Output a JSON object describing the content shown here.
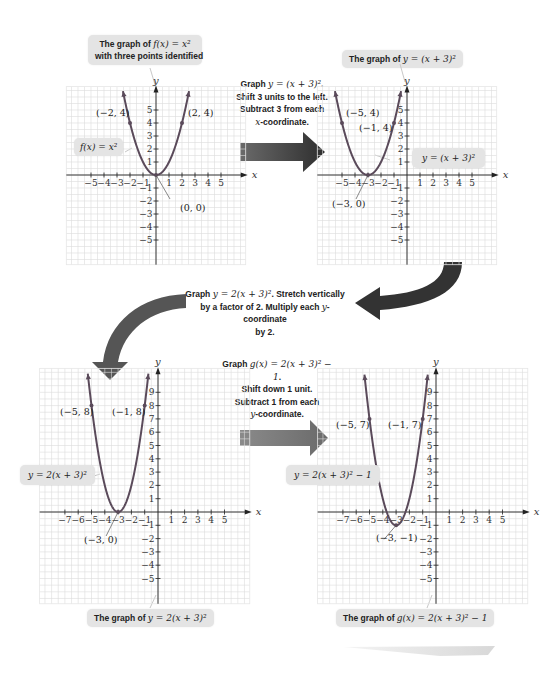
{
  "colors": {
    "curve": "#5a4a5a",
    "curve_light": "#6e5e6e",
    "grid": "#dcdcdc",
    "axis": "#222222",
    "callout_bg": "#e4e4e4",
    "arrow_dark": "#3c3c3c"
  },
  "top_callout_1": {
    "line1_pre": "The graph of ",
    "line1_math": "f(x) = x²",
    "line2": "with three points identified"
  },
  "top_callout_2": {
    "pre": "The graph of ",
    "math": "y = (x + 3)²"
  },
  "step_1": {
    "line1_pre": "Graph ",
    "line1_math": "y = (x + 3)²",
    "line1_post": ".",
    "line2": "Shift 3 units to the left.",
    "line3": "Subtract 3 from each",
    "line4_math": "x",
    "line4_post": "-coordinate."
  },
  "step_2": {
    "line1_pre": "Graph ",
    "line1_math": "y = 2(x + 3)²",
    "line1_post": ". Stretch vertically",
    "line2_pre": "by a factor of 2. Multiply each ",
    "line2_math": "y",
    "line2_post": "-coordinate",
    "line3": "by 2."
  },
  "step_3": {
    "line1_pre": "Graph ",
    "line1_math": "g(x) = 2(x + 3)² − 1",
    "line1_post": ".",
    "line2": "Shift down 1 unit.",
    "line3": "Subtract 1 from each",
    "line4_math": "y",
    "line4_post": "-coordinate."
  },
  "bottom_callout_1": {
    "pre": "The graph of ",
    "math": "y = 2(x + 3)²"
  },
  "bottom_callout_2": {
    "pre": "The graph of ",
    "math": "g(x) = 2(x + 3)² − 1"
  },
  "chart_data": [
    {
      "type": "line",
      "title": "The graph of f(x) = x² with three points identified",
      "function": "f(x) = x^2",
      "curve_label": "f(x) = x²",
      "xlabel": "x",
      "ylabel": "y",
      "xlim": [
        -5,
        5
      ],
      "ylim": [
        -5,
        5
      ],
      "x_ticks": [
        -5,
        -4,
        -3,
        -2,
        -1,
        1,
        2,
        3,
        4,
        5
      ],
      "y_ticks": [
        -5,
        -4,
        -3,
        -2,
        -1,
        1,
        2,
        3,
        4,
        5
      ],
      "grid": true,
      "points": [
        {
          "x": -2,
          "y": 4,
          "label": "(−2, 4)"
        },
        {
          "x": 0,
          "y": 0,
          "label": "(0, 0)"
        },
        {
          "x": 2,
          "y": 4,
          "label": "(2, 4)"
        }
      ]
    },
    {
      "type": "line",
      "title": "The graph of y = (x + 3)²",
      "function": "y = (x+3)^2",
      "curve_label": "y = (x + 3)²",
      "xlabel": "x",
      "ylabel": "y",
      "xlim": [
        -5,
        5
      ],
      "ylim": [
        -5,
        5
      ],
      "x_ticks": [
        -5,
        -4,
        -3,
        -2,
        -1,
        1,
        2,
        3,
        4,
        5
      ],
      "y_ticks": [
        -5,
        -4,
        -3,
        -2,
        -1,
        1,
        2,
        3,
        4,
        5
      ],
      "grid": true,
      "points": [
        {
          "x": -5,
          "y": 4,
          "label": "(−5, 4)"
        },
        {
          "x": -3,
          "y": 0,
          "label": "(−3, 0)"
        },
        {
          "x": -1,
          "y": 4,
          "label": "(−1, 4)"
        }
      ]
    },
    {
      "type": "line",
      "title": "The graph of y = 2(x + 3)²",
      "function": "y = 2(x+3)^2",
      "curve_label": "y = 2(x + 3)²",
      "xlabel": "x",
      "ylabel": "y",
      "xlim": [
        -7,
        5
      ],
      "ylim": [
        -5,
        9
      ],
      "x_ticks": [
        -7,
        -6,
        -5,
        -4,
        -3,
        -2,
        -1,
        1,
        2,
        3,
        4,
        5
      ],
      "y_ticks": [
        -5,
        -4,
        -3,
        -2,
        -1,
        1,
        2,
        3,
        4,
        5,
        6,
        7,
        8,
        9
      ],
      "grid": true,
      "points": [
        {
          "x": -5,
          "y": 8,
          "label": "(−5, 8)"
        },
        {
          "x": -3,
          "y": 0,
          "label": "(−3, 0)"
        },
        {
          "x": -1,
          "y": 8,
          "label": "(−1, 8)"
        }
      ]
    },
    {
      "type": "line",
      "title": "The graph of g(x) = 2(x + 3)² − 1",
      "function": "g(x) = 2(x+3)^2 - 1",
      "curve_label": "y = 2(x + 3)² − 1",
      "xlabel": "x",
      "ylabel": "y",
      "xlim": [
        -7,
        5
      ],
      "ylim": [
        -5,
        9
      ],
      "x_ticks": [
        -7,
        -6,
        -5,
        -4,
        -3,
        -2,
        -1,
        1,
        2,
        3,
        4,
        5
      ],
      "y_ticks": [
        -5,
        -4,
        -3,
        -2,
        -1,
        1,
        2,
        3,
        4,
        5,
        6,
        7,
        8,
        9
      ],
      "grid": true,
      "points": [
        {
          "x": -5,
          "y": 7,
          "label": "(−5, 7)"
        },
        {
          "x": -3,
          "y": -1,
          "label": "(−3, −1)"
        },
        {
          "x": -1,
          "y": 7,
          "label": "(−1, 7)"
        }
      ]
    }
  ]
}
